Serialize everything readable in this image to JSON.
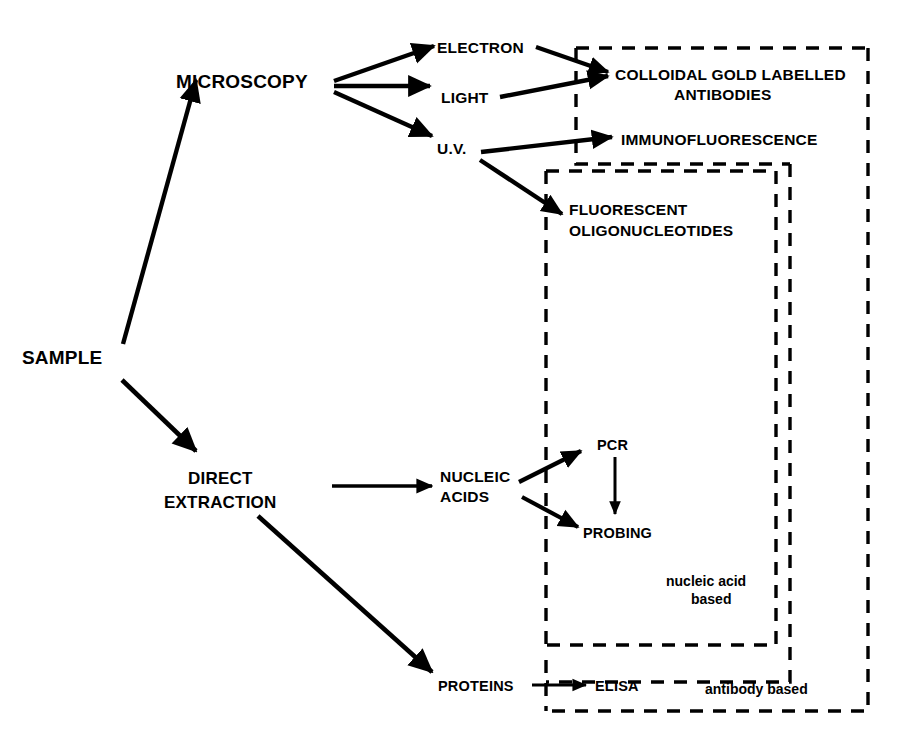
{
  "diagram": {
    "background_color": "#ffffff",
    "ink_color": "#000000",
    "nodes": {
      "sample": "SAMPLE",
      "microscopy": "MICROSCOPY",
      "electron": "ELECTRON",
      "light": "LIGHT",
      "uv": "U.V.",
      "colloidal_gold_line1": "COLLOIDAL GOLD LABELLED",
      "colloidal_gold_line2": "ANTIBODIES",
      "immunofluorescence": "IMMUNOFLUORESCENCE",
      "fluorescent_line1": "FLUORESCENT",
      "fluorescent_line2": "OLIGONUCLEOTIDES",
      "direct_extraction_line1": "DIRECT",
      "direct_extraction_line2": "EXTRACTION",
      "nucleic_acids_line1": "NUCLEIC",
      "nucleic_acids_line2": "ACIDS",
      "pcr": "PCR",
      "probing": "PROBING",
      "proteins": "PROTEINS",
      "elisa": "ELISA"
    },
    "groups": {
      "nucleic_acid_based_line1": "nucleic acid",
      "nucleic_acid_based_line2": "based",
      "antibody_based": "antibody based"
    }
  }
}
